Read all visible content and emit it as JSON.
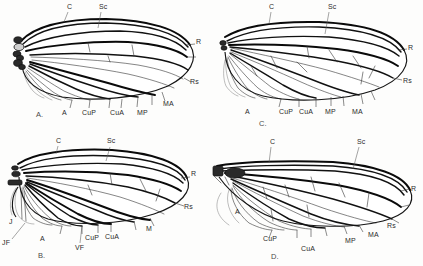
{
  "figure": {
    "background_color": "#fdfdfc",
    "ink_color": "#111111",
    "panel_count": 4
  },
  "panels": [
    {
      "id": "A",
      "letter": "A.",
      "position": "top-left",
      "labels": {
        "top": [
          "C",
          "Sc"
        ],
        "right": [
          "R",
          "Rs"
        ],
        "bottom": [
          "A",
          "CuP",
          "CuA",
          "MP",
          "MA"
        ]
      }
    },
    {
      "id": "C",
      "letter": "C.",
      "position": "top-right",
      "labels": {
        "top": [
          "C",
          "Sc"
        ],
        "right": [
          "R",
          "Rs"
        ],
        "bottom": [
          "A",
          "CuP",
          "CuA",
          "MP",
          "MA"
        ]
      }
    },
    {
      "id": "B",
      "letter": "B.",
      "position": "bottom-left",
      "labels": {
        "top": [
          "C",
          "Sc"
        ],
        "right": [
          "R",
          "Rs"
        ],
        "bottom": [
          "J",
          "JF",
          "A",
          "CuP",
          "CuA",
          "VF",
          "M"
        ]
      }
    },
    {
      "id": "D",
      "letter": "D.",
      "position": "bottom-right",
      "labels": {
        "top": [
          "C",
          "Sc"
        ],
        "right": [
          "R",
          "Rs"
        ],
        "bottom": [
          "A",
          "CuP",
          "CuA",
          "MP",
          "MA"
        ]
      }
    }
  ],
  "panel_a": {
    "letter": "A.",
    "label_c": "C",
    "label_sc": "Sc",
    "label_r": "R",
    "label_rs": "Rs",
    "label_a": "A",
    "label_cup": "CuP",
    "label_cua": "CuA",
    "label_mp": "MP",
    "label_ma": "MA"
  },
  "panel_c": {
    "letter": "C.",
    "label_c": "C",
    "label_sc": "Sc",
    "label_r": "R",
    "label_rs": "Rs",
    "label_a": "A",
    "label_cup": "CuP",
    "label_cua": "CuA",
    "label_mp": "MP",
    "label_ma": "MA"
  },
  "panel_b": {
    "letter": "B.",
    "label_c": "C",
    "label_sc": "Sc",
    "label_r": "R",
    "label_rs": "Rs",
    "label_j": "J",
    "label_jf": "JF",
    "label_a": "A",
    "label_cup": "CuP",
    "label_cua": "CuA",
    "label_vf": "VF",
    "label_m": "M"
  },
  "panel_d": {
    "letter": "D.",
    "label_c": "C",
    "label_sc": "Sc",
    "label_r": "R",
    "label_rs": "Rs",
    "label_a": "A",
    "label_cup": "CuP",
    "label_cua": "CuA",
    "label_mp": "MP",
    "label_ma": "MA"
  }
}
